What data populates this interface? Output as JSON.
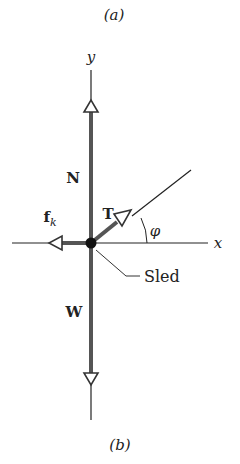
{
  "panel_top_label": "(a)",
  "panel_bottom_label": "(b)",
  "axes": {
    "x_label": "x",
    "y_label": "y"
  },
  "forces": {
    "normal": "N",
    "weight": "W",
    "tension": "T",
    "friction": "f",
    "friction_sub": "k"
  },
  "angle_label": "φ",
  "object_label": "Sled",
  "colors": {
    "force_vector": "#555555",
    "axis": "#222222",
    "dot": "#111111"
  }
}
